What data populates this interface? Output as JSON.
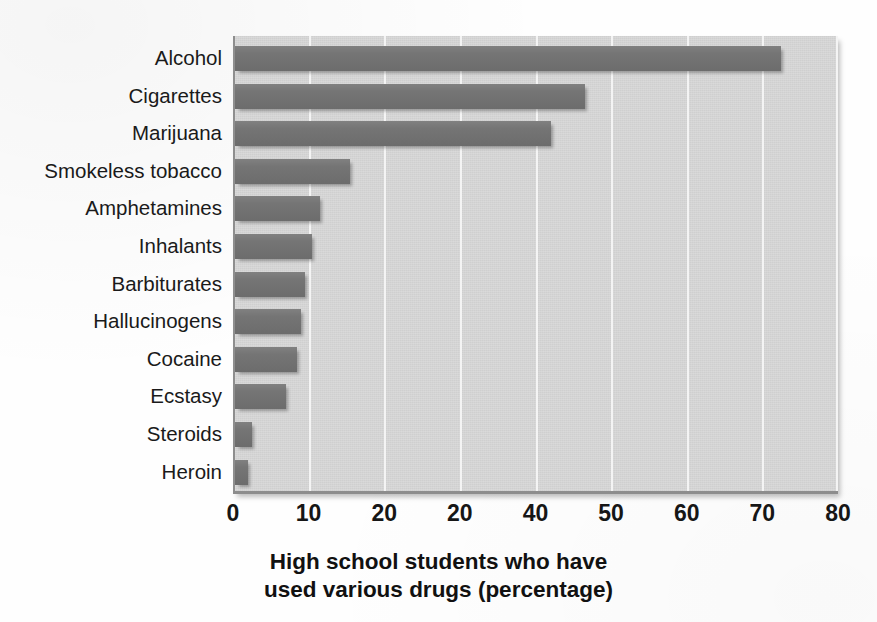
{
  "chart_data": {
    "type": "bar",
    "orientation": "horizontal",
    "title": "",
    "xlabel": "High school students who have used various drugs (percentage)",
    "ylabel": "",
    "xlim": [
      0,
      80
    ],
    "grid": true,
    "legend": null,
    "categories": [
      "Alcohol",
      "Cigarettes",
      "Marijuana",
      "Smokeless tobacco",
      "Amphetamines",
      "Inhalants",
      "Barbiturates",
      "Hallucinogens",
      "Cocaine",
      "Ecstasy",
      "Steroids",
      "Heroin"
    ],
    "values": [
      72.5,
      46.5,
      42,
      15.5,
      11.5,
      10.5,
      9.5,
      9,
      8.5,
      7,
      2.5,
      2
    ],
    "xticks": [
      0,
      10,
      20,
      30,
      40,
      50,
      60,
      70,
      80
    ],
    "xtick_labels": [
      "0",
      "10",
      "20",
      "20",
      "40",
      "50",
      "60",
      "70",
      "80"
    ],
    "colors": {
      "bar": "#727272",
      "panel_background": "#d3d3d3",
      "gridline": "#f4f4f4",
      "page_background": "#fefefe",
      "text": "#161616"
    }
  },
  "axis_title": {
    "line1": "High school students who have",
    "line2": "used various drugs (percentage)"
  }
}
